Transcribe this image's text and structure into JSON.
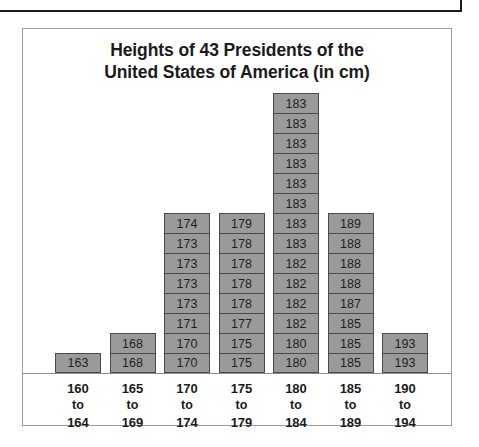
{
  "chart_title": "Heights of 43 Presidents of the United States of America (in cm)",
  "chart_title_line1": "Heights of 43 Presidents of the",
  "chart_title_line2": "United States of America (in cm)",
  "colors": {
    "cell_fill": "#9a9a9a",
    "cell_border": "#4a4a4a",
    "frame_border": "#9d9d9d",
    "axis_line": "#8d8d8d",
    "text": "#1b1b1b",
    "background": "#ffffff",
    "top_box_border": "#1b1b1b"
  },
  "axis_connector_word": "to",
  "chart_data": {
    "type": "bar",
    "title": "Heights of 43 Presidents of the United States of America (in cm)",
    "xlabel": "",
    "ylabel": "",
    "grid": false,
    "legend": "none",
    "note": "Stacked dot-plot / stacked-cell histogram: each cell is one president, labelled with that president's height in cm.",
    "total_count": 43,
    "categories": [
      "160 to 164",
      "165 to 169",
      "170 to 174",
      "175 to 179",
      "180 to 184",
      "185 to 189",
      "190 to 194"
    ],
    "values": [
      1,
      2,
      8,
      8,
      14,
      8,
      2
    ],
    "bins": [
      {
        "label_lines": [
          "160",
          "to",
          "164"
        ],
        "range_low": 160,
        "range_high": 164,
        "count": 1,
        "cells": [
          "163"
        ]
      },
      {
        "label_lines": [
          "165",
          "to",
          "169"
        ],
        "range_low": 165,
        "range_high": 169,
        "count": 2,
        "cells": [
          "168",
          "168"
        ]
      },
      {
        "label_lines": [
          "170",
          "to",
          "174"
        ],
        "range_low": 170,
        "range_high": 174,
        "count": 8,
        "cells": [
          "170",
          "170",
          "171",
          "173",
          "173",
          "173",
          "173",
          "174"
        ]
      },
      {
        "label_lines": [
          "175",
          "to",
          "179"
        ],
        "range_low": 175,
        "range_high": 179,
        "count": 8,
        "cells": [
          "175",
          "175",
          "177",
          "178",
          "178",
          "178",
          "178",
          "179"
        ]
      },
      {
        "label_lines": [
          "180",
          "to",
          "184"
        ],
        "range_low": 180,
        "range_high": 184,
        "count": 14,
        "cells": [
          "180",
          "180",
          "182",
          "182",
          "182",
          "182",
          "183",
          "183",
          "183",
          "183",
          "183",
          "183",
          "183",
          "183"
        ]
      },
      {
        "label_lines": [
          "185",
          "to",
          "189"
        ],
        "range_low": 185,
        "range_high": 189,
        "count": 8,
        "cells": [
          "185",
          "185",
          "185",
          "187",
          "188",
          "188",
          "188",
          "189"
        ]
      },
      {
        "label_lines": [
          "190",
          "to",
          "194"
        ],
        "range_low": 190,
        "range_high": 194,
        "count": 2,
        "cells": [
          "193",
          "193"
        ]
      }
    ]
  }
}
